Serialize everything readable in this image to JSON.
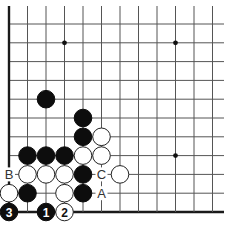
{
  "diagram": {
    "type": "go-board-diagram",
    "visible_region": "lower-left corner",
    "grid": {
      "origin_x": 9,
      "origin_y": 24,
      "spacing_x": 18.5,
      "spacing_y": 18.8,
      "columns": 12,
      "rows": 11,
      "extend_right_to": 224,
      "extend_top_to": 6,
      "left_edge": true,
      "bottom_edge": true
    },
    "colors": {
      "black_stone": "#0d0d0d",
      "white_stone": "#ffffff",
      "grid": "#555555",
      "label": "#333333"
    },
    "star_points": [
      {
        "col": 3,
        "row": 1
      },
      {
        "col": 9,
        "row": 1
      },
      {
        "col": 9,
        "row": 7
      }
    ],
    "stones": [
      {
        "color": "black",
        "col": 2,
        "row": 4,
        "label": ""
      },
      {
        "color": "black",
        "col": 4,
        "row": 5,
        "label": ""
      },
      {
        "color": "black",
        "col": 4,
        "row": 6,
        "label": ""
      },
      {
        "color": "white",
        "col": 5,
        "row": 6,
        "label": ""
      },
      {
        "color": "black",
        "col": 1,
        "row": 7,
        "label": ""
      },
      {
        "color": "black",
        "col": 2,
        "row": 7,
        "label": ""
      },
      {
        "color": "black",
        "col": 3,
        "row": 7,
        "label": ""
      },
      {
        "color": "white",
        "col": 4,
        "row": 7,
        "label": ""
      },
      {
        "color": "white",
        "col": 5,
        "row": 7,
        "label": ""
      },
      {
        "color": "white",
        "col": 1,
        "row": 8,
        "label": ""
      },
      {
        "color": "white",
        "col": 2,
        "row": 8,
        "label": ""
      },
      {
        "color": "white",
        "col": 3,
        "row": 8,
        "label": ""
      },
      {
        "color": "black",
        "col": 4,
        "row": 8,
        "label": ""
      },
      {
        "color": "white",
        "col": 6,
        "row": 8,
        "label": ""
      },
      {
        "color": "white",
        "col": 0,
        "row": 9,
        "label": ""
      },
      {
        "color": "black",
        "col": 1,
        "row": 9,
        "label": ""
      },
      {
        "color": "white",
        "col": 3,
        "row": 9,
        "label": ""
      },
      {
        "color": "black",
        "col": 4,
        "row": 9,
        "label": ""
      },
      {
        "color": "black",
        "col": 0,
        "row": 10,
        "label": "3"
      },
      {
        "color": "black",
        "col": 2,
        "row": 10,
        "label": "1"
      },
      {
        "color": "white",
        "col": 3,
        "row": 10,
        "label": "2"
      }
    ],
    "point_labels": [
      {
        "text": "B",
        "col": 0,
        "row": 8
      },
      {
        "text": "C",
        "col": 5,
        "row": 8
      },
      {
        "text": "A",
        "col": 5,
        "row": 9
      }
    ]
  }
}
